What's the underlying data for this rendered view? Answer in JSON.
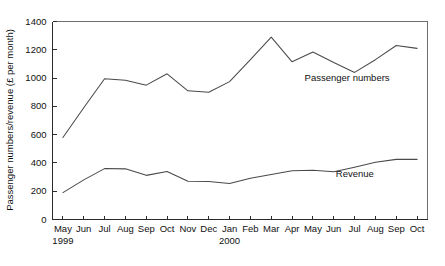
{
  "chart_data": {
    "type": "line",
    "title": "",
    "xlabel": "",
    "ylabel": "Passenger numbers/revenue (£ per month)",
    "ylim": [
      0,
      1400
    ],
    "yticks": [
      0,
      200,
      400,
      600,
      800,
      1000,
      1200,
      1400
    ],
    "ytick_labels": [
      "0",
      "200",
      "400",
      "600",
      "800",
      "1000",
      "1200",
      "1400"
    ],
    "grid": false,
    "legend_position": "inline-annotation",
    "categories": [
      "May",
      "Jun",
      "Jul",
      "Aug",
      "Sep",
      "Oct",
      "Nov",
      "Dec",
      "Jan",
      "Feb",
      "Mar",
      "Apr",
      "May",
      "Jun",
      "Jul",
      "Aug",
      "Sep",
      "Oct"
    ],
    "year_markers": [
      {
        "label": "1999",
        "category_index": 0
      },
      {
        "label": "2000",
        "category_index": 8
      }
    ],
    "series": [
      {
        "name": "Passenger numbers",
        "label_category_index": 11.6,
        "label_value": 980,
        "values": [
          580,
          790,
          995,
          985,
          950,
          1030,
          910,
          900,
          975,
          1130,
          1290,
          1115,
          1185,
          1110,
          1040,
          1130,
          1230,
          1210
        ]
      },
      {
        "name": "Revenue",
        "label_category_index": 13.1,
        "label_value": 300,
        "values": [
          190,
          280,
          360,
          358,
          312,
          340,
          270,
          268,
          255,
          292,
          318,
          345,
          348,
          338,
          370,
          405,
          425,
          425
        ]
      }
    ]
  },
  "labels": {
    "ylabel": "Passenger numbers/revenue (£ per month)",
    "series_passenger": "Passenger numbers",
    "series_revenue": "Revenue",
    "year_1999": "1999",
    "year_2000": "2000"
  }
}
